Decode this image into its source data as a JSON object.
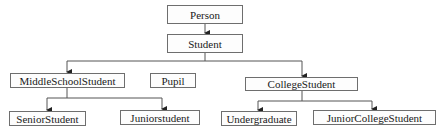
{
  "diagram": {
    "nodes": {
      "person": "Person",
      "student": "Student",
      "middle_school_student": "MiddleSchoolStudent",
      "pupil": "Pupil",
      "college_student": "CollegeStudent",
      "senior_student": "SeniorStudent",
      "junior_student": "Juniorstudent",
      "undergraduate": "Undergraduate",
      "junior_college_student": "JuniorCollegeStudent"
    },
    "edges": [
      {
        "from": "Person",
        "to": "Student"
      },
      {
        "from": "Student",
        "to": "MiddleSchoolStudent"
      },
      {
        "from": "Student",
        "to": "CollegeStudent"
      },
      {
        "from": "MiddleSchoolStudent",
        "to": "SeniorStudent"
      },
      {
        "from": "MiddleSchoolStudent",
        "to": "Juniorstudent"
      },
      {
        "from": "CollegeStudent",
        "to": "Undergraduate"
      },
      {
        "from": "CollegeStudent",
        "to": "JuniorCollegeStudent"
      }
    ],
    "colors": {
      "line": "#444444",
      "border": "#6e6e6e",
      "text": "#1a1a1a"
    }
  }
}
